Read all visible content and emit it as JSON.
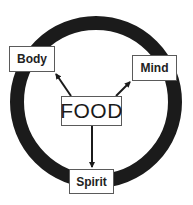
{
  "diagram": {
    "type": "cycle",
    "center": {
      "label": "FOOD",
      "box": {
        "x": 61,
        "y": 96,
        "w": 61,
        "h": 30
      }
    },
    "ring": {
      "cx": 96,
      "cy": 102,
      "r": 79,
      "stroke_width": 14,
      "color": "#1b1b1b"
    },
    "nodes": [
      {
        "id": "body",
        "label": "Body",
        "box": {
          "x": 9,
          "y": 46,
          "w": 46,
          "h": 26
        }
      },
      {
        "id": "mind",
        "label": "Mind",
        "box": {
          "x": 132,
          "y": 55,
          "w": 45,
          "h": 26
        }
      },
      {
        "id": "spirit",
        "label": "Spirit",
        "box": {
          "x": 69,
          "y": 169,
          "w": 45,
          "h": 25
        }
      }
    ],
    "edges": [
      {
        "from": "FOOD",
        "to": "Body",
        "x1": 71,
        "y1": 96,
        "x2": 55,
        "y2": 73
      },
      {
        "from": "FOOD",
        "to": "Mind",
        "x1": 116,
        "y1": 96,
        "x2": 131,
        "y2": 81
      },
      {
        "from": "FOOD",
        "to": "Spirit",
        "x1": 92,
        "y1": 126,
        "x2": 92,
        "y2": 168
      }
    ],
    "colors": {
      "ring": "#1b1b1b",
      "arrow": "#1b1b1b",
      "box_border": "#5a5a5a",
      "text": "#222222",
      "background": "#ffffff"
    }
  }
}
